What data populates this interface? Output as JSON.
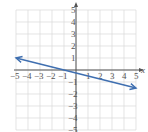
{
  "graph": {
    "x_axis_label": "x",
    "y_axis_label": "y",
    "x_range": [
      -5,
      5
    ],
    "y_range": [
      -5,
      5
    ],
    "x_ticks": [
      "−5",
      "−4",
      "−3",
      "−2",
      "−1",
      "1",
      "2",
      "3",
      "4",
      "5"
    ],
    "y_ticks": [
      "5",
      "4",
      "3",
      "2",
      "1",
      "−1",
      "−2",
      "−3",
      "−4",
      "−5"
    ],
    "line": {
      "start": [
        -5,
        1
      ],
      "end": [
        5,
        -1.5
      ],
      "equation": "y = -x/4 - 1/4",
      "color": "#3f6fb0"
    },
    "grid_color": "#d8d8d8",
    "axis_color": "#555555"
  },
  "chart_data": {
    "type": "line",
    "title": "",
    "xlabel": "x",
    "ylabel": "y",
    "xlim": [
      -5,
      5
    ],
    "ylim": [
      -5,
      5
    ],
    "grid": true,
    "series": [
      {
        "name": "line",
        "x": [
          -5,
          -1,
          0,
          5
        ],
        "values": [
          1,
          0,
          -0.25,
          -1.5
        ]
      }
    ]
  }
}
